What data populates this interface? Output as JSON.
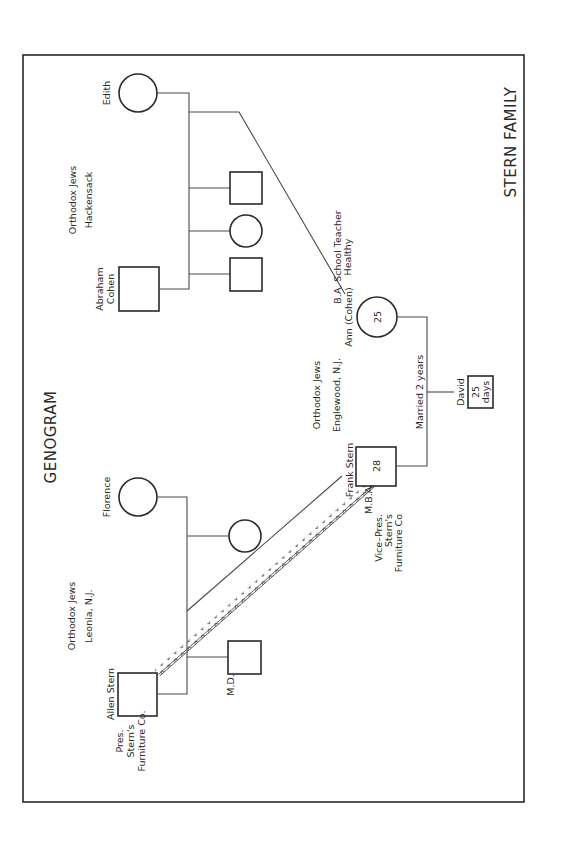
{
  "document": {
    "title": "GENOGRAM",
    "family_label": "STERN FAMILY",
    "orientation": "rotated-90-ccw"
  },
  "groups": {
    "cohen": {
      "line1": "Orthodox Jews",
      "line2": "Hackensack"
    },
    "stern": {
      "line1": "Orthodox Jews",
      "line2": "Leonia, N.J."
    },
    "couple": {
      "line1": "Orthodox Jews",
      "line2": "Englewood, N.J."
    }
  },
  "people": {
    "edith": {
      "name": "Edith",
      "sex": "female"
    },
    "abraham": {
      "name_line1": "Abraham",
      "name_line2": "Cohen",
      "sex": "male"
    },
    "cohen_sibling_1": {
      "sex": "male"
    },
    "cohen_sibling_2": {
      "sex": "female"
    },
    "cohen_sibling_3": {
      "sex": "male"
    },
    "ann": {
      "name": "Ann (Cohen)",
      "age": "25",
      "note_line1": "B.A. School Teacher",
      "note_line2": "Healthy",
      "sex": "female"
    },
    "florence": {
      "name": "Florence",
      "sex": "female"
    },
    "allen": {
      "name": "Allen Stern",
      "note_line1": "Pres.",
      "note_line2": "Stern's",
      "note_line3": "Furniture Co.",
      "sex": "male"
    },
    "stern_sibling_md": {
      "note": "M.D.",
      "sex": "male"
    },
    "stern_sibling_f": {
      "sex": "female"
    },
    "frank": {
      "name": "Frank Stern",
      "age": "28",
      "note_line1": "M.B.A.",
      "note_line2": "Vice–Pres.",
      "note_line3": "Stern's",
      "note_line4": "Furniture Co",
      "sex": "male"
    },
    "david": {
      "name": "David",
      "age_line1": "25",
      "age_line2": "days",
      "sex": "male"
    }
  },
  "relationships": {
    "marriage_label": "Married 2 years",
    "conflict": {
      "from": "Allen Stern",
      "to": "Frank Stern",
      "style": "zigzag"
    }
  },
  "colors": {
    "ink": "#2a2a2a",
    "line": "#4a4a4a",
    "paper": "#ffffff"
  }
}
